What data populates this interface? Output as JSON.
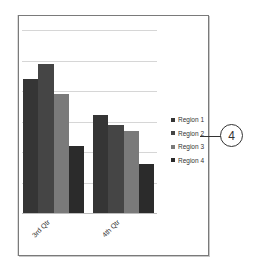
{
  "chart_data": {
    "type": "bar",
    "title": "",
    "xlabel": "",
    "ylabel": "",
    "categories": [
      "3rd Qtr",
      "4th Qtr"
    ],
    "series": [
      {
        "name": "Region 1",
        "values": [
          4.4,
          3.2
        ],
        "color": "#353535"
      },
      {
        "name": "Region 2",
        "values": [
          4.9,
          2.9
        ],
        "color": "#454545"
      },
      {
        "name": "Region 3",
        "values": [
          3.9,
          2.7
        ],
        "color": "#7a7a7a"
      },
      {
        "name": "Region 4",
        "values": [
          2.2,
          1.6
        ],
        "color": "#2b2b2b"
      }
    ],
    "ylim": [
      0,
      6
    ],
    "gridlines": 6,
    "grid": true,
    "y_tick_labels_visible": false,
    "legend_position": "right",
    "x_label_rotation": -45
  },
  "legend": {
    "items": [
      {
        "label": "Region 1",
        "color": "#353535"
      },
      {
        "label": "Region 2",
        "color": "#454545"
      },
      {
        "label": "Region 3",
        "color": "#7a7a7a"
      },
      {
        "label": "Region 4",
        "color": "#2b2b2b"
      }
    ]
  },
  "callout": {
    "number": "4"
  },
  "colors": {
    "frame_border": "#7a7a7a",
    "gridline": "#d6d6d6",
    "text": "#333333"
  }
}
